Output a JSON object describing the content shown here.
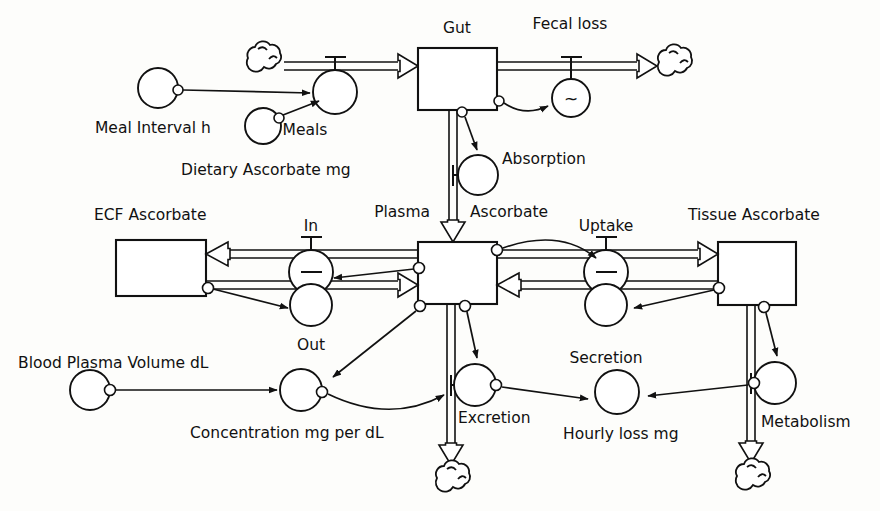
{
  "diagram": {
    "type": "system-dynamics-stock-and-flow",
    "background_color": "#fdfdfb",
    "line_color": "#111111",
    "stocks": [
      {
        "id": "gut",
        "label": "Gut"
      },
      {
        "id": "plasma_ascorbate",
        "label_part1": "Plasma",
        "label_part2": "Ascorbate",
        "label": "Plasma Ascorbate"
      },
      {
        "id": "ecf_ascorbate",
        "label": "ECF Ascorbate"
      },
      {
        "id": "tissue_ascorbate",
        "label": "Tissue Ascorbate"
      }
    ],
    "flows": [
      {
        "id": "meals",
        "label": "Meals"
      },
      {
        "id": "fecal_loss",
        "label": "Fecal loss"
      },
      {
        "id": "absorption",
        "label": "Absorption"
      },
      {
        "id": "in",
        "label": "In"
      },
      {
        "id": "out",
        "label": "Out"
      },
      {
        "id": "uptake",
        "label": "Uptake"
      },
      {
        "id": "secretion",
        "label": "Secretion"
      },
      {
        "id": "excretion",
        "label": "Excretion"
      },
      {
        "id": "metabolism",
        "label": "Metabolism"
      }
    ],
    "auxiliaries": [
      {
        "id": "meal_interval",
        "label": "Meal Interval h"
      },
      {
        "id": "dietary_ascorbate",
        "label": "Dietary Ascorbate mg"
      },
      {
        "id": "blood_plasma_volume",
        "label": "Blood Plasma Volume dL"
      },
      {
        "id": "concentration",
        "label": "Concentration mg per dL"
      },
      {
        "id": "hourly_loss",
        "label": "Hourly loss mg"
      },
      {
        "id": "fecal_rate_symbol",
        "label": "~"
      }
    ]
  }
}
